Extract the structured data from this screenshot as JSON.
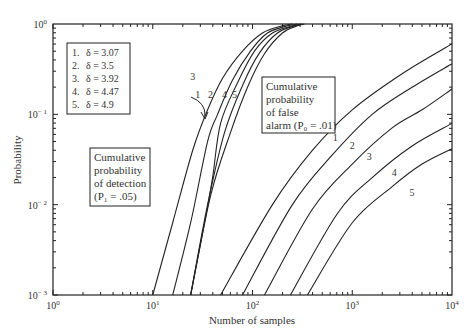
{
  "chart_data": {
    "type": "line",
    "title": "",
    "xlabel": "Number of samples",
    "ylabel": "Probability",
    "xscale": "log",
    "yscale": "log",
    "xlim": [
      1,
      10000
    ],
    "ylim": [
      0.001,
      1
    ],
    "x_ticks": [
      "10^0",
      "10^1",
      "10^2",
      "10^3",
      "10^4"
    ],
    "y_ticks": [
      "10^0",
      "10^-1",
      "10^-2",
      "10^-3"
    ],
    "legend": [
      {
        "id": "1",
        "label": "δ = 3.07"
      },
      {
        "id": "2",
        "label": "δ = 3.5"
      },
      {
        "id": "3",
        "label": "δ = 3.92"
      },
      {
        "id": "4",
        "label": "δ = 4.47"
      },
      {
        "id": "5",
        "label": "δ = 4.9"
      }
    ],
    "annotations": {
      "detection": [
        "Cumulative",
        "probability",
        "of detection",
        "(P₁ = .05)"
      ],
      "false_alarm": [
        "Cumulative",
        "probability",
        "of false",
        "alarm (P₀ = .01)"
      ]
    },
    "series_note": "points are [log10(N), log10(P)]",
    "series": [
      {
        "name": "Detection 1 (δ=3.07)",
        "group": "detection",
        "points": [
          [
            1.0,
            -3
          ],
          [
            1.2,
            -2.2
          ],
          [
            1.4,
            -1.4
          ],
          [
            1.55,
            -0.95
          ],
          [
            1.7,
            -0.6
          ],
          [
            1.9,
            -0.3
          ],
          [
            2.1,
            -0.1
          ],
          [
            2.3,
            -0.02
          ],
          [
            2.4,
            0
          ]
        ]
      },
      {
        "name": "Detection 2 (δ=3.5)",
        "group": "detection",
        "points": [
          [
            1.2,
            -3
          ],
          [
            1.38,
            -2.2
          ],
          [
            1.55,
            -1.3
          ],
          [
            1.65,
            -1.0
          ],
          [
            1.8,
            -0.62
          ],
          [
            1.98,
            -0.3
          ],
          [
            2.15,
            -0.1
          ],
          [
            2.35,
            -0.02
          ],
          [
            2.45,
            0
          ]
        ]
      },
      {
        "name": "Detection 3 (δ=3.92)",
        "group": "detection",
        "points": [
          [
            1.38,
            -3
          ],
          [
            1.52,
            -2.2
          ],
          [
            1.6,
            -1.7
          ],
          [
            1.68,
            -1.1
          ],
          [
            1.85,
            -0.65
          ],
          [
            2.02,
            -0.3
          ],
          [
            2.2,
            -0.1
          ],
          [
            2.4,
            -0.02
          ],
          [
            2.48,
            0
          ]
        ]
      },
      {
        "name": "Detection 4 (δ=4.47)",
        "group": "detection",
        "points": [
          [
            1.38,
            -3
          ],
          [
            1.55,
            -2.0
          ],
          [
            1.72,
            -1.2
          ],
          [
            1.9,
            -0.68
          ],
          [
            2.07,
            -0.32
          ],
          [
            2.25,
            -0.1
          ],
          [
            2.42,
            -0.02
          ],
          [
            2.5,
            0
          ]
        ]
      },
      {
        "name": "Detection 5 (δ=4.9)",
        "group": "detection",
        "points": [
          [
            1.38,
            -3
          ],
          [
            1.58,
            -1.9
          ],
          [
            1.78,
            -1.2
          ],
          [
            1.95,
            -0.7
          ],
          [
            2.12,
            -0.33
          ],
          [
            2.3,
            -0.1
          ],
          [
            2.45,
            -0.02
          ],
          [
            2.52,
            0
          ]
        ]
      },
      {
        "name": "False alarm 1 (δ=3.07)",
        "group": "false_alarm",
        "points": [
          [
            1.68,
            -3
          ],
          [
            2.2,
            -2.0
          ],
          [
            2.6,
            -1.4
          ],
          [
            3.0,
            -0.95
          ],
          [
            3.5,
            -0.55
          ],
          [
            4.0,
            -0.22
          ]
        ]
      },
      {
        "name": "False alarm 2 (δ=3.5)",
        "group": "false_alarm",
        "points": [
          [
            1.9,
            -3
          ],
          [
            2.4,
            -2.0
          ],
          [
            2.8,
            -1.45
          ],
          [
            3.2,
            -1.0
          ],
          [
            3.6,
            -0.7
          ],
          [
            4.0,
            -0.44
          ]
        ]
      },
      {
        "name": "False alarm 3 (δ=3.92)",
        "group": "false_alarm",
        "points": [
          [
            2.12,
            -3
          ],
          [
            2.6,
            -2.05
          ],
          [
            3.0,
            -1.55
          ],
          [
            3.4,
            -1.15
          ],
          [
            3.7,
            -0.95
          ],
          [
            4.0,
            -0.72
          ]
        ]
      },
      {
        "name": "False alarm 4 (δ=4.47)",
        "group": "false_alarm",
        "points": [
          [
            2.38,
            -3
          ],
          [
            2.85,
            -2.1
          ],
          [
            3.2,
            -1.7
          ],
          [
            3.6,
            -1.35
          ],
          [
            4.0,
            -1.1
          ]
        ]
      },
      {
        "name": "False alarm 5 (δ=4.9)",
        "group": "false_alarm",
        "points": [
          [
            2.55,
            -3
          ],
          [
            3.0,
            -2.2
          ],
          [
            3.4,
            -1.8
          ],
          [
            3.7,
            -1.55
          ],
          [
            4.0,
            -1.38
          ]
        ]
      }
    ],
    "curve_labels": [
      {
        "text": "1",
        "x": 1.45,
        "y": -0.82
      },
      {
        "text": "2",
        "x": 1.58,
        "y": -0.82
      },
      {
        "text": "3",
        "x": 1.4,
        "y": -0.62
      },
      {
        "text": "4",
        "x": 1.72,
        "y": -0.82
      },
      {
        "text": "5",
        "x": 1.82,
        "y": -0.82
      },
      {
        "text": "1",
        "x": 2.83,
        "y": -1.3
      },
      {
        "text": "2",
        "x": 3.0,
        "y": -1.38
      },
      {
        "text": "3",
        "x": 3.17,
        "y": -1.5
      },
      {
        "text": "4",
        "x": 3.42,
        "y": -1.68
      },
      {
        "text": "5",
        "x": 3.6,
        "y": -1.9
      }
    ]
  }
}
